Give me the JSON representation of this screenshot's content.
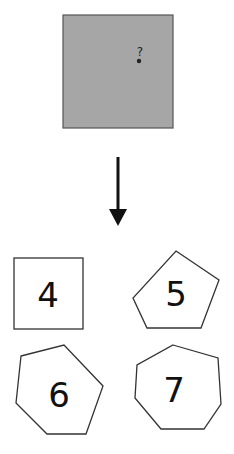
{
  "source_box": {
    "fill": "#a6a6a6",
    "question_mark": "?",
    "dot": true
  },
  "arrow": {
    "direction": "down"
  },
  "options": [
    {
      "shape": "square",
      "sides": 4,
      "label": "4"
    },
    {
      "shape": "pentagon",
      "sides": 5,
      "label": "5"
    },
    {
      "shape": "hexagon",
      "sides": 6,
      "label": "6"
    },
    {
      "shape": "heptagon",
      "sides": 7,
      "label": "7"
    }
  ]
}
